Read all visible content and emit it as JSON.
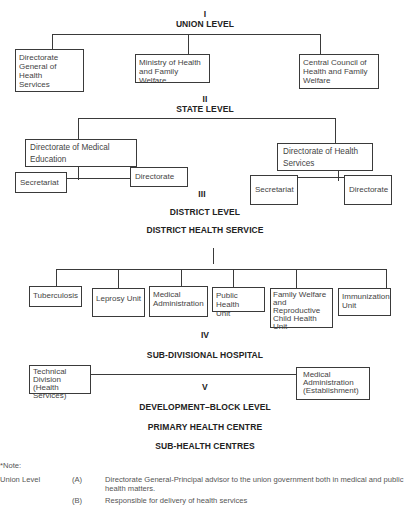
{
  "levels": {
    "union": {
      "numeral": "I",
      "title": "UNION LEVEL"
    },
    "state": {
      "numeral": "II",
      "title": "STATE LEVEL"
    },
    "district": {
      "numeral": "III",
      "title": "DISTRICT LEVEL",
      "subtitle": "DISTRICT HEALTH SERVICE"
    },
    "subdivisional": {
      "numeral": "IV",
      "title": "SUB-DIVISIONAL HOSPITAL"
    },
    "block": {
      "numeral": "V",
      "title": "DEVELOPMENT–BLOCK LEVEL",
      "subtitle": "PRIMARY HEALTH CENTRE",
      "subtitle2": "SUB-HEALTH CENTRES"
    }
  },
  "union_boxes": [
    "Directorate\nGeneral of Health\nServices",
    "Ministry of Health\nand Family Welfare",
    "Central Council of\nHealth and Family\nWelfare"
  ],
  "state_boxes": {
    "left": {
      "title": "Directorate of Medical\nEducation",
      "children": [
        "Secretariat",
        "Directorate"
      ]
    },
    "right": {
      "title": "Directorate of Health\nServices",
      "children": [
        "Secretariat",
        "Directorate"
      ]
    }
  },
  "district_boxes": [
    "Tuberculosis",
    "Leprosy Unit",
    "Medical\nAdministration",
    "Public Health\nUnit",
    "Family Welfare\nand Reproductive\nChild Health\nUnit",
    "Immunization\nUnit"
  ],
  "subdivisional_boxes": [
    "Technical\nDivision (Health\nServices)",
    "Medical\nAdministration\n(Establishment)"
  ],
  "notes": {
    "label": "*Note:",
    "section": "Union Level",
    "items": [
      {
        "marker": "(A)",
        "text": "Directorate General-Principal advisor to the union government both in medical and public",
        "text2": "health matters."
      },
      {
        "marker": "(B)",
        "text": "Responsible for delivery of health services"
      }
    ]
  }
}
